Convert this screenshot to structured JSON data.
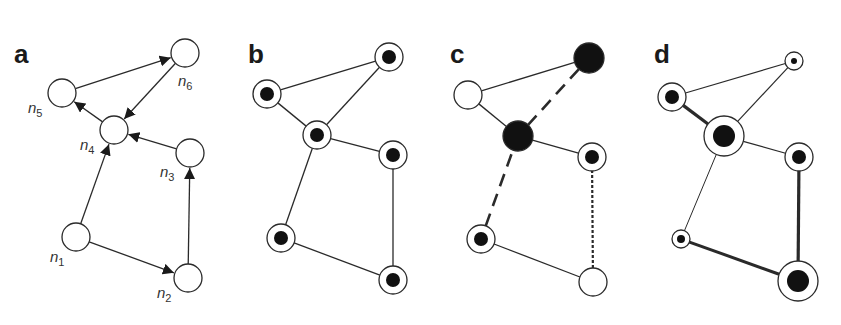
{
  "figure": {
    "colors": {
      "stroke": "#2a2a2a",
      "fill_white": "#ffffff",
      "fill_dark": "#111111"
    },
    "panels": [
      {
        "id": "a",
        "letter": "a",
        "letter_pos": [
          14,
          63
        ],
        "description": "directed network with labeled nodes",
        "nodes": [
          {
            "id": "n1",
            "label": "n",
            "sub": "1",
            "x": 76,
            "y": 237,
            "r": 14,
            "inner": 0,
            "fill": "white",
            "label_pos": [
              50,
              262
            ]
          },
          {
            "id": "n2",
            "label": "n",
            "sub": "2",
            "x": 188,
            "y": 278,
            "r": 14,
            "inner": 0,
            "fill": "white",
            "label_pos": [
              157,
              298
            ]
          },
          {
            "id": "n3",
            "label": "n",
            "sub": "3",
            "x": 190,
            "y": 153,
            "r": 14,
            "inner": 0,
            "fill": "white",
            "label_pos": [
              160,
              177
            ]
          },
          {
            "id": "n4",
            "label": "n",
            "sub": "4",
            "x": 114,
            "y": 130,
            "r": 14,
            "inner": 0,
            "fill": "white",
            "label_pos": [
              80,
              150
            ]
          },
          {
            "id": "n5",
            "label": "n",
            "sub": "5",
            "x": 62,
            "y": 93,
            "r": 14,
            "inner": 0,
            "fill": "white",
            "label_pos": [
              28,
              113
            ]
          },
          {
            "id": "n6",
            "label": "n",
            "sub": "6",
            "x": 185,
            "y": 53,
            "r": 14,
            "inner": 0,
            "fill": "white",
            "label_pos": [
              178,
              86
            ]
          }
        ],
        "edges": [
          {
            "from": "n1",
            "to": "n2",
            "style": "solid",
            "width": 1.3,
            "arrow": true
          },
          {
            "from": "n1",
            "to": "n4",
            "style": "solid",
            "width": 1.3,
            "arrow": true
          },
          {
            "from": "n2",
            "to": "n3",
            "style": "solid",
            "width": 1.3,
            "arrow": true
          },
          {
            "from": "n3",
            "to": "n4",
            "style": "solid",
            "width": 1.3,
            "arrow": true
          },
          {
            "from": "n4",
            "to": "n5",
            "style": "solid",
            "width": 1.3,
            "arrow": true
          },
          {
            "from": "n5",
            "to": "n6",
            "style": "solid",
            "width": 1.3,
            "arrow": true
          },
          {
            "from": "n6",
            "to": "n4",
            "style": "solid",
            "width": 1.3,
            "arrow": true
          }
        ]
      },
      {
        "id": "b",
        "letter": "b",
        "letter_pos": [
          248,
          63
        ],
        "description": "undirected network, all nodes ringed with dark core",
        "nodes": [
          {
            "id": "n1",
            "x": 281,
            "y": 238,
            "r": 14,
            "inner": 7,
            "fill": "white"
          },
          {
            "id": "n2",
            "x": 393,
            "y": 280,
            "r": 14,
            "inner": 7,
            "fill": "white"
          },
          {
            "id": "n3",
            "x": 393,
            "y": 155,
            "r": 14,
            "inner": 7,
            "fill": "white"
          },
          {
            "id": "n4",
            "x": 317,
            "y": 135,
            "r": 14,
            "inner": 7,
            "fill": "white"
          },
          {
            "id": "n5",
            "x": 267,
            "y": 94,
            "r": 14,
            "inner": 7,
            "fill": "white"
          },
          {
            "id": "n6",
            "x": 389,
            "y": 57,
            "r": 14,
            "inner": 7,
            "fill": "white"
          }
        ],
        "edges": [
          {
            "from": "n1",
            "to": "n2",
            "style": "solid",
            "width": 1.3
          },
          {
            "from": "n1",
            "to": "n4",
            "style": "solid",
            "width": 1.3
          },
          {
            "from": "n2",
            "to": "n3",
            "style": "solid",
            "width": 1.3
          },
          {
            "from": "n3",
            "to": "n4",
            "style": "solid",
            "width": 1.3
          },
          {
            "from": "n4",
            "to": "n5",
            "style": "solid",
            "width": 1.3
          },
          {
            "from": "n5",
            "to": "n6",
            "style": "solid",
            "width": 1.3
          },
          {
            "from": "n6",
            "to": "n4",
            "style": "solid",
            "width": 1.3
          }
        ]
      },
      {
        "id": "c",
        "letter": "c",
        "letter_pos": [
          450,
          63
        ],
        "description": "mixed node states with dashed and dotted edges",
        "nodes": [
          {
            "id": "n1",
            "x": 481,
            "y": 239,
            "r": 14,
            "inner": 7,
            "fill": "white"
          },
          {
            "id": "n2",
            "x": 593,
            "y": 282,
            "r": 14,
            "inner": 0,
            "fill": "white"
          },
          {
            "id": "n3",
            "x": 592,
            "y": 157,
            "r": 14,
            "inner": 7,
            "fill": "white"
          },
          {
            "id": "n4",
            "x": 518,
            "y": 136,
            "r": 15,
            "inner": 15,
            "fill": "dark"
          },
          {
            "id": "n5",
            "x": 468,
            "y": 95,
            "r": 14,
            "inner": 0,
            "fill": "white"
          },
          {
            "id": "n6",
            "x": 589,
            "y": 58,
            "r": 15,
            "inner": 15,
            "fill": "dark"
          }
        ],
        "edges": [
          {
            "from": "n1",
            "to": "n2",
            "style": "solid",
            "width": 1.3
          },
          {
            "from": "n1",
            "to": "n4",
            "style": "dashed",
            "width": 2.6
          },
          {
            "from": "n2",
            "to": "n3",
            "style": "dotted",
            "width": 2.2
          },
          {
            "from": "n3",
            "to": "n4",
            "style": "solid",
            "width": 1.3
          },
          {
            "from": "n4",
            "to": "n5",
            "style": "solid",
            "width": 1.3
          },
          {
            "from": "n5",
            "to": "n6",
            "style": "solid",
            "width": 1.3
          },
          {
            "from": "n6",
            "to": "n4",
            "style": "dashed",
            "width": 2.6
          }
        ]
      },
      {
        "id": "d",
        "letter": "d",
        "letter_pos": [
          654,
          63
        ],
        "description": "weighted network with node sizes and edge thickness",
        "nodes": [
          {
            "id": "n1",
            "x": 681,
            "y": 239,
            "r": 9,
            "inner": 4,
            "fill": "white"
          },
          {
            "id": "n2",
            "x": 798,
            "y": 281,
            "r": 20,
            "inner": 11,
            "fill": "white"
          },
          {
            "id": "n3",
            "x": 799,
            "y": 157,
            "r": 14,
            "inner": 7,
            "fill": "white"
          },
          {
            "id": "n4",
            "x": 724,
            "y": 136,
            "r": 20,
            "inner": 11,
            "fill": "white"
          },
          {
            "id": "n5",
            "x": 672,
            "y": 97,
            "r": 14,
            "inner": 7,
            "fill": "white"
          },
          {
            "id": "n6",
            "x": 794,
            "y": 61,
            "r": 9,
            "inner": 3,
            "fill": "white"
          }
        ],
        "edges": [
          {
            "from": "n1",
            "to": "n2",
            "style": "solid",
            "width": 3.0
          },
          {
            "from": "n1",
            "to": "n4",
            "style": "solid",
            "width": 1.0
          },
          {
            "from": "n2",
            "to": "n3",
            "style": "solid",
            "width": 3.2
          },
          {
            "from": "n3",
            "to": "n4",
            "style": "solid",
            "width": 1.2
          },
          {
            "from": "n4",
            "to": "n5",
            "style": "solid",
            "width": 3.2
          },
          {
            "from": "n5",
            "to": "n6",
            "style": "solid",
            "width": 1.2
          },
          {
            "from": "n6",
            "to": "n4",
            "style": "solid",
            "width": 1.2
          }
        ]
      }
    ]
  }
}
